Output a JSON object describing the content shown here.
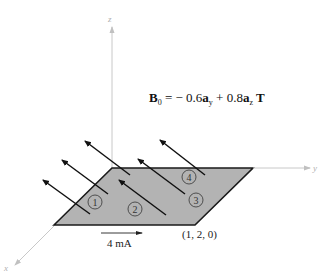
{
  "figure": {
    "axes": {
      "x_label": "x",
      "y_label": "y",
      "z_label": "z"
    },
    "field_equation": {
      "symbol": "B",
      "subscript": "0",
      "equals": " = − 0.6",
      "term1_vector": "a",
      "term1_sub": "y",
      "plus": " + 0.8",
      "term2_vector": "a",
      "term2_sub": "z",
      "unit": " T"
    },
    "regions": [
      "1",
      "2",
      "3",
      "4"
    ],
    "current_label": "4 mA",
    "corner_point_label": "(1, 2, 0)",
    "colors": {
      "plate_fill": "#b3b3b3",
      "plate_edge": "#1a1a1a",
      "axis": "#c8c8c8",
      "field_arrow": "#111111"
    }
  }
}
